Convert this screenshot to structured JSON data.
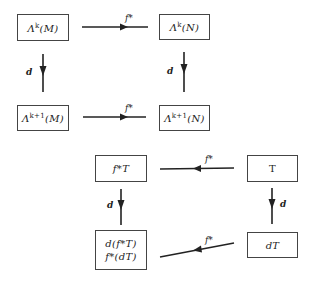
{
  "diagrams": [
    {
      "name": "exterior-derivative-commutes-with-pullback",
      "nodes": {
        "top_left": {
          "base": "Λ",
          "sup": "k",
          "arg": "(M)"
        },
        "top_right": {
          "base": "Λ",
          "sup": "k",
          "arg": "(N)"
        },
        "bottom_left": {
          "base": "Λ",
          "sup": "k+1",
          "arg": "(M)"
        },
        "bottom_right": {
          "base": "Λ",
          "sup": "k+1",
          "arg": "(N)"
        }
      },
      "arrows": {
        "top": "f*",
        "bottom": "f*",
        "left": "d",
        "right": "d"
      }
    },
    {
      "name": "form-pullback-square",
      "nodes": {
        "top_left": "f*T",
        "top_right": "T",
        "bottom_left_line1": "d(f*T)",
        "bottom_left_line2": "f*(dT)",
        "bottom_right": "dT"
      },
      "arrows": {
        "top": "f*",
        "bottom": "f*",
        "left": "d",
        "right": "d"
      }
    }
  ]
}
